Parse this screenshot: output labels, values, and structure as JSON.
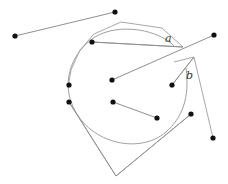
{
  "labels": [
    {
      "id": "a",
      "text": "a",
      "x": 165,
      "y": 42
    },
    {
      "id": "b",
      "text": "b",
      "x": 186,
      "y": 79
    }
  ],
  "points": [
    {
      "id": "p1",
      "x": 15,
      "y": 36
    },
    {
      "id": "p2",
      "x": 115,
      "y": 12
    },
    {
      "id": "p3",
      "x": 92,
      "y": 42
    },
    {
      "id": "p4",
      "x": 214,
      "y": 35
    },
    {
      "id": "p5",
      "x": 112,
      "y": 80
    },
    {
      "id": "p6",
      "x": 172,
      "y": 85
    },
    {
      "id": "p7",
      "x": 69,
      "y": 85
    },
    {
      "id": "p8",
      "x": 69,
      "y": 102
    },
    {
      "id": "p9",
      "x": 113,
      "y": 102
    },
    {
      "id": "p10",
      "x": 157,
      "y": 118
    },
    {
      "id": "p11",
      "x": 191,
      "y": 114
    },
    {
      "id": "p12",
      "x": 213,
      "y": 138
    }
  ],
  "segments": [
    {
      "from": "p1",
      "to": "p2"
    },
    {
      "from": "p3",
      "to": "a_tip"
    },
    {
      "from": "p5",
      "to": "p4"
    },
    {
      "from": "p6",
      "to": "b_tip"
    },
    {
      "from": "p9",
      "to": "p10"
    },
    {
      "from": "p8",
      "to": "bottom_apex"
    },
    {
      "from": "bottom_apex",
      "to": "p11"
    }
  ],
  "shapes": {
    "outer_polygon": "M 183,47 L 162,28 L 121,22 L 94,34 L 80,50 L 71,70 L 68,88",
    "right_polygon": "M 174,62 L 194,57 L 213,138",
    "inner_arc": "M 175,47 C 160,30 120,22 95,37 C 72,52 62,80 72,104 C 86,142 138,156 166,132 C 182,118 190,98 186,68",
    "chords": [
      "M 92,42 L 183,47",
      "M 172,85 L 194,57"
    ],
    "bottom_lines": [
      "M 69,102 L 116,176",
      "M 116,176 L 191,114"
    ]
  }
}
